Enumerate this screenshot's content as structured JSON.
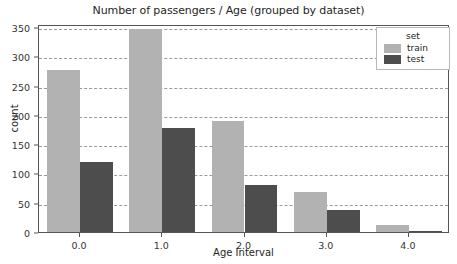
{
  "chart_data": {
    "type": "bar",
    "title": "Number of passengers / Age (grouped by dataset)",
    "xlabel": "Age Interval",
    "ylabel": "count",
    "categories": [
      "0.0",
      "1.0",
      "2.0",
      "3.0",
      "4.0"
    ],
    "series": [
      {
        "name": "train",
        "color": "#b2b2b2",
        "values": [
          277,
          347,
          189,
          69,
          12
        ]
      },
      {
        "name": "test",
        "color": "#4d4d4d",
        "values": [
          120,
          178,
          81,
          37,
          2
        ]
      }
    ],
    "legend": {
      "title": "set",
      "position": "upper-right",
      "entries": [
        "train",
        "test"
      ]
    },
    "ylim": [
      0,
      355
    ],
    "yticks": [
      0,
      50,
      100,
      150,
      200,
      250,
      300,
      350
    ],
    "ytick_labels": [
      "0",
      "50",
      "100",
      "150",
      "200",
      "250",
      "300",
      "350"
    ],
    "xtick_labels": [
      "0.0",
      "1.0",
      "2.0",
      "3.0",
      "4.0"
    ],
    "grid": {
      "x": false,
      "y": true,
      "style": "dashed",
      "color": "#8a8a8a"
    },
    "background": "#ffffff",
    "axes_color": "#555555"
  }
}
